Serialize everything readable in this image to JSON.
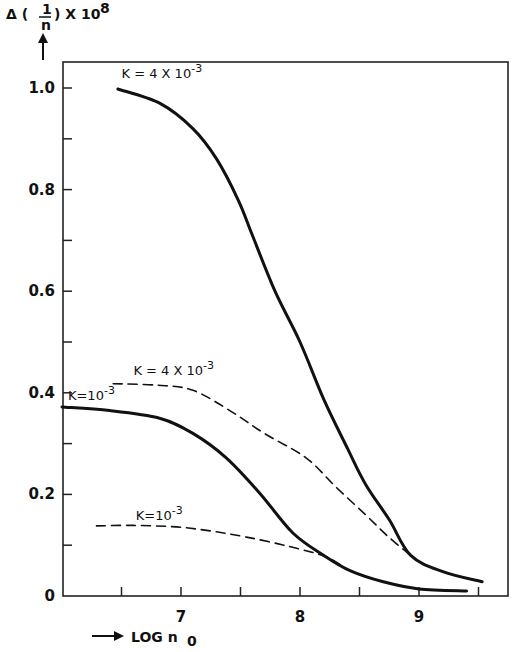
{
  "chart_data": {
    "type": "line",
    "title": "",
    "ylabel": "Δ(1/n) × 10^8",
    "ylabel_parts": {
      "delta": "Δ (",
      "numerator": "1",
      "denominator": "n",
      "suffix": ") X 10",
      "exponent": "8"
    },
    "xlabel": "LOG n0",
    "xlabel_parts": {
      "arrow": "⟶",
      "text": "LOG n",
      "subscript": "0"
    },
    "xlim": [
      6.0,
      9.75
    ],
    "ylim": [
      0,
      1.07
    ],
    "grid": false,
    "legend": "inline labels next to curves",
    "x_ticks": [
      6.5,
      7,
      7.5,
      8,
      8.5,
      9,
      9.5
    ],
    "x_tick_labels": [
      {
        "value": 7,
        "label": "7"
      },
      {
        "value": 8,
        "label": "8"
      },
      {
        "value": 9,
        "label": "9"
      }
    ],
    "y_ticks": [
      0.1,
      0.2,
      0.3,
      0.4,
      0.5,
      0.6,
      0.7,
      0.8,
      0.9,
      1.0
    ],
    "y_tick_labels": [
      {
        "value": 0,
        "label": "0"
      },
      {
        "value": 0.2,
        "label": "0.2"
      },
      {
        "value": 0.4,
        "label": "0.4"
      },
      {
        "value": 0.6,
        "label": "0.6"
      },
      {
        "value": 0.8,
        "label": "0.8"
      },
      {
        "value": 1.0,
        "label": "1.0"
      }
    ],
    "series": [
      {
        "name": "K = 4 X 10-3 (solid)",
        "label": "K = 4 X 10",
        "label_exp": "-3",
        "style": "solid",
        "label_pos": {
          "x": 6.5,
          "y": 1.02
        },
        "x": [
          6.47,
          6.82,
          7.1,
          7.3,
          7.48,
          7.6,
          7.79,
          8.0,
          8.2,
          8.4,
          8.55,
          8.75,
          8.93,
          9.2,
          9.53
        ],
        "y": [
          0.998,
          0.97,
          0.92,
          0.86,
          0.78,
          0.71,
          0.6,
          0.5,
          0.387,
          0.29,
          0.22,
          0.15,
          0.08,
          0.048,
          0.028
        ]
      },
      {
        "name": "K = 4 X 10-3 (dashed)",
        "label": "K = 4 X 10",
        "label_exp": "-3",
        "style": "dashed",
        "label_pos": {
          "x": 6.6,
          "y": 0.435
        },
        "x": [
          6.43,
          6.8,
          7.1,
          7.43,
          7.7,
          8.05,
          8.3,
          8.55,
          8.75,
          8.93
        ],
        "y": [
          0.418,
          0.415,
          0.405,
          0.362,
          0.32,
          0.272,
          0.215,
          0.16,
          0.115,
          0.08
        ]
      },
      {
        "name": "K = 10-3 (solid)",
        "label": "K=10",
        "label_exp": "-3",
        "style": "solid",
        "label_pos": {
          "x": 6.05,
          "y": 0.385
        },
        "x": [
          6.0,
          6.4,
          6.82,
          7.1,
          7.38,
          7.66,
          7.94,
          8.2,
          8.42,
          8.7,
          9.0,
          9.4
        ],
        "y": [
          0.372,
          0.365,
          0.35,
          0.32,
          0.272,
          0.203,
          0.124,
          0.08,
          0.05,
          0.028,
          0.014,
          0.01
        ]
      },
      {
        "name": "K = 10-3 (dashed)",
        "label": "K=10",
        "label_exp": "-3",
        "style": "dashed",
        "label_pos": {
          "x": 6.62,
          "y": 0.15
        },
        "x": [
          6.29,
          6.6,
          6.96,
          7.25,
          7.55,
          7.9,
          8.22,
          8.42,
          8.6
        ],
        "y": [
          0.138,
          0.139,
          0.136,
          0.128,
          0.116,
          0.098,
          0.077,
          0.05,
          0.035
        ]
      }
    ]
  }
}
